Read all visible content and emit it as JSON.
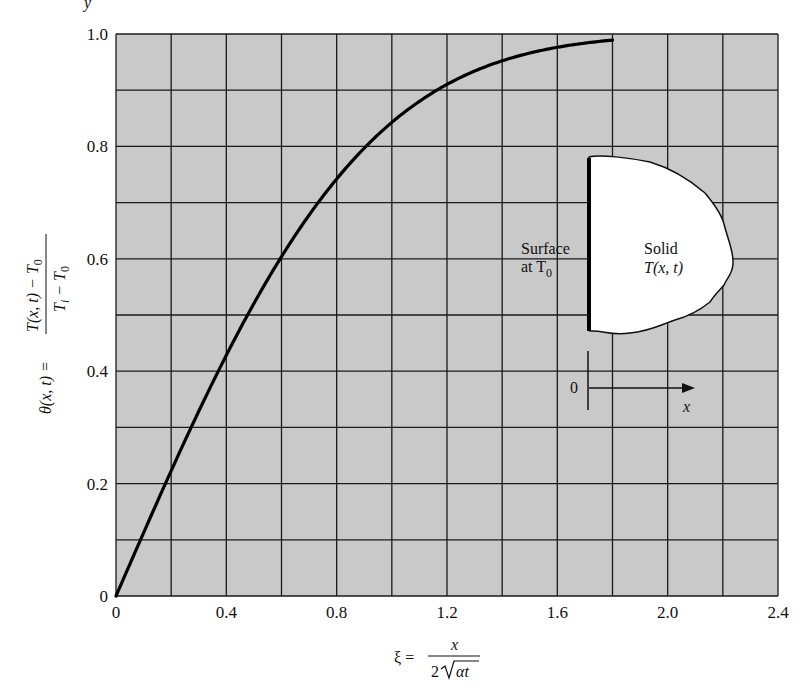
{
  "chart_data": {
    "type": "line",
    "title": "",
    "xlabel": "ξ = x / (2√(αt))",
    "ylabel": "θ(x, t) = (T(x, t) − T0) / (Ti − T0)",
    "xlim": [
      0,
      2.4
    ],
    "ylim": [
      0,
      1.0
    ],
    "grid": true,
    "x_grid_step": 0.2,
    "y_grid_step": 0.1,
    "x_ticks": [
      0,
      0.4,
      0.8,
      1.2,
      1.6,
      2.0,
      2.4
    ],
    "x_tick_labels": [
      "0",
      "0.4",
      "0.8",
      "1.2",
      "1.6",
      "2.0",
      "2.4"
    ],
    "y_ticks": [
      0,
      0.2,
      0.4,
      0.6,
      0.8,
      1.0
    ],
    "y_tick_labels": [
      "0",
      "0.2",
      "0.4",
      "0.6",
      "0.8",
      "1.0"
    ],
    "series": [
      {
        "name": "θ = erf(ξ)",
        "x": [
          0,
          0.1,
          0.2,
          0.3,
          0.4,
          0.5,
          0.6,
          0.7,
          0.8,
          0.9,
          1.0,
          1.1,
          1.2,
          1.3,
          1.4,
          1.5,
          1.6,
          1.7,
          1.8
        ],
        "y": [
          0,
          0.112,
          0.223,
          0.329,
          0.428,
          0.52,
          0.604,
          0.678,
          0.742,
          0.797,
          0.843,
          0.88,
          0.91,
          0.934,
          0.952,
          0.966,
          0.976,
          0.984,
          0.989
        ]
      }
    ],
    "colors": {
      "plot_background": "#c9c9c9",
      "grid": "#1a1a1a",
      "curve": "#000000",
      "inset_fill": "#ffffff"
    }
  },
  "ylabel_parts": {
    "lhs": "θ(x, t) =",
    "numerator": "T(x, t) − T",
    "numerator_sub": "0",
    "denominator": "T",
    "denominator_sub_i": "i",
    "denominator_mid": " − T",
    "denominator_sub": "0"
  },
  "xlabel_parts": {
    "lhs": "ξ =",
    "numerator": "x",
    "denominator_pre": "2",
    "denominator_rad": "αt"
  },
  "inset": {
    "surface_label_line1": "Surface",
    "surface_label_line2": "at T",
    "surface_label_sub": "0",
    "solid_label_line1": "Solid",
    "solid_label_line2": "T(x, t)",
    "origin_label": "0",
    "axis_label": "x"
  },
  "page_fragment": "y"
}
